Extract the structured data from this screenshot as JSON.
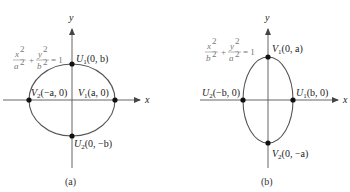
{
  "figure": {
    "panels": [
      {
        "id": "a",
        "caption": "(a)",
        "equation": {
          "lhs1_num": "x",
          "lhs1_den": "a",
          "lhs2_num": "y",
          "lhs2_den": "b",
          "exp": "2",
          "rhs": "= 1",
          "plus": "+"
        },
        "axis_labels": {
          "x": "x",
          "y": "y"
        },
        "points": [
          {
            "name": "U",
            "sub": "1",
            "coords": "(0, b)"
          },
          {
            "name": "V",
            "sub": "2",
            "coords": "(−a, 0)"
          },
          {
            "name": "V",
            "sub": "1",
            "coords": "(a, 0)"
          },
          {
            "name": "U",
            "sub": "2",
            "coords": "(0, −b)"
          }
        ]
      },
      {
        "id": "b",
        "caption": "(b)",
        "equation": {
          "lhs1_num": "x",
          "lhs1_den": "b",
          "lhs2_num": "y",
          "lhs2_den": "a",
          "exp": "2",
          "rhs": "= 1",
          "plus": "+"
        },
        "axis_labels": {
          "x": "x",
          "y": "y"
        },
        "points": [
          {
            "name": "V",
            "sub": "1",
            "coords": "(0, a)"
          },
          {
            "name": "U",
            "sub": "2",
            "coords": "(−b, 0)"
          },
          {
            "name": "U",
            "sub": "1",
            "coords": "(b, 0)"
          },
          {
            "name": "V",
            "sub": "2",
            "coords": "(0, −a)"
          }
        ]
      }
    ],
    "colors": {
      "axis": "#555555",
      "ellipse": "#555555",
      "point": "#111111",
      "equation": "#777777"
    }
  }
}
